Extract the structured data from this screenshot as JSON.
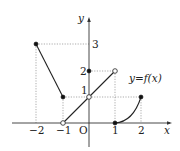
{
  "diagram": {
    "function_label": "y=f(x)",
    "axes": {
      "x_label": "x",
      "y_label": "y",
      "origin_label": "O"
    },
    "x_ticks": [
      {
        "value": -2,
        "label": "−2"
      },
      {
        "value": -1,
        "label": "−1"
      },
      {
        "value": 1,
        "label": "1"
      },
      {
        "value": 2,
        "label": "2"
      }
    ],
    "y_ticks": [
      {
        "value": 1,
        "label": "1"
      },
      {
        "value": 2,
        "label": "2"
      },
      {
        "value": 3,
        "label": "3"
      }
    ],
    "pieces": [
      {
        "type": "segment",
        "from": [
          -2,
          3
        ],
        "to": [
          -1,
          1
        ],
        "from_closed": true,
        "to_closed": true
      },
      {
        "type": "segment",
        "from": [
          -1,
          0
        ],
        "to": [
          1,
          2
        ],
        "from_closed": false,
        "to_closed": false,
        "open_point_on_line": [
          0,
          1
        ]
      },
      {
        "type": "curve",
        "from": [
          1,
          0
        ],
        "to": [
          2,
          1
        ],
        "from_closed": true,
        "to_closed": true
      }
    ],
    "marked_points": [
      {
        "at": [
          0,
          2
        ],
        "style": "filled"
      },
      {
        "at": [
          0,
          1
        ],
        "style": "open"
      }
    ]
  }
}
